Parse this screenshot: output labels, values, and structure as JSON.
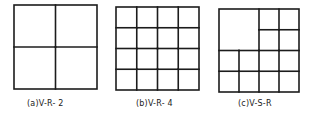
{
  "figures": [
    {
      "id": "a",
      "label": "(a)V-R- 2",
      "rows": 2,
      "cols": 2,
      "merged": [],
      "box": {
        "x": 14,
        "y": 5,
        "w": 83,
        "h": 84
      },
      "label_pos": {
        "x": 27,
        "y": 99
      }
    },
    {
      "id": "b",
      "label": "(b)V-R- 4",
      "rows": 4,
      "cols": 4,
      "merged": [],
      "box": {
        "x": 116,
        "y": 7,
        "w": 83,
        "h": 83
      },
      "label_pos": {
        "x": 136,
        "y": 99
      }
    },
    {
      "id": "c",
      "label": "(c)V-S-R",
      "rows": 4,
      "cols": 4,
      "merged": [
        {
          "row": 0,
          "col": 0,
          "rowspan": 2,
          "colspan": 2
        }
      ],
      "box": {
        "x": 219,
        "y": 9,
        "w": 80,
        "h": 83
      },
      "label_pos": {
        "x": 238,
        "y": 99
      }
    }
  ],
  "style": {
    "line_color": "#1c1c1c",
    "line_width": 1.6
  }
}
